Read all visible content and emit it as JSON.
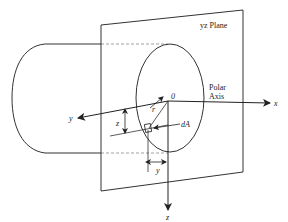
{
  "diagram": {
    "type": "cylinder cross-section in yz plane with polar axis",
    "labels": {
      "plane": "yz Plane",
      "polar_axis_line1": "Polar",
      "polar_axis_line2": "Axis",
      "origin": "0",
      "x_axis": "x",
      "y_axis": "y",
      "z_axis": "z",
      "radius": "r",
      "area_element": "dA",
      "z_dimension": "z",
      "y_dimension": "y"
    },
    "colors": {
      "line": "#333333",
      "dashed": "#888888",
      "background": "#ffffff"
    }
  }
}
